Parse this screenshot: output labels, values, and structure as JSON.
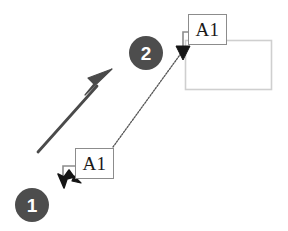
{
  "figure": {
    "type": "ui-interaction-diagram",
    "background_color": "#ffffff",
    "width": 288,
    "height": 231
  },
  "nodes": {
    "top_box": {
      "label": "A1",
      "x": 188,
      "y": 14,
      "width": 39,
      "height": 31,
      "border_color": "#8c8c8c",
      "fill_color": "#ffffff"
    },
    "bottom_box": {
      "label": "A1",
      "x": 75,
      "y": 148,
      "width": 39,
      "height": 31,
      "border_color": "#8c8c8c",
      "fill_color": "#ffffff"
    }
  },
  "container_rect": {
    "x": 185,
    "y": 40,
    "width": 87,
    "height": 50,
    "stroke_color": "#cfcfcf",
    "fill_color": "#ffffff"
  },
  "steps": [
    {
      "number": "1",
      "cx": 32,
      "cy": 205,
      "radius": 17,
      "fill_color": "#4d4d4d",
      "text_color": "#ffffff"
    },
    {
      "number": "2",
      "cx": 146,
      "cy": 53,
      "radius": 17,
      "fill_color": "#4d4d4d",
      "text_color": "#ffffff"
    }
  ],
  "connectors": {
    "drag_arrow": {
      "name": "drag-direction-arrow",
      "from": [
        38,
        152
      ],
      "to": [
        112,
        70
      ],
      "color": "#4a4a4a",
      "stroke_width": 3
    },
    "move_path": {
      "name": "element-move-path",
      "from": [
        113,
        147
      ],
      "to": [
        183,
        52
      ],
      "color": "#555555",
      "stroke_width": 1.4,
      "style": "dotted"
    },
    "bottom_hook": {
      "name": "bottom-anchor-hook",
      "color": "#8c8c8c",
      "arrow_color": "#1a1a1a",
      "arrow_tip": [
        65,
        186
      ],
      "arrow_direction": "down-left"
    },
    "top_hook": {
      "name": "top-anchor-hook",
      "color": "#8c8c8c",
      "arrow_color": "#1a1a1a",
      "arrow_tip": [
        183,
        60
      ],
      "arrow_direction": "down"
    }
  },
  "colors": {
    "badge_fill": "#4d4d4d",
    "badge_text": "#ffffff",
    "box_border": "#8c8c8c",
    "container_stroke": "#cfcfcf",
    "arrow_dark": "#4a4a4a",
    "cursor_black": "#1a1a1a"
  }
}
